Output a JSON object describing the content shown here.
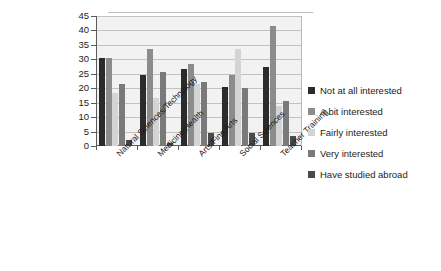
{
  "chart_data": {
    "type": "bar",
    "title": "",
    "subtitle": "",
    "xlabel": "",
    "ylabel": "",
    "ylim": [
      0,
      45
    ],
    "ytick_step": 5,
    "yticks": [
      0,
      5,
      10,
      15,
      20,
      25,
      30,
      35,
      40,
      45
    ],
    "grid": true,
    "legend_position": "right",
    "categories": [
      "Natural Sciences/Technology",
      "Medicine/Health",
      "Arts/Fine Arts",
      "Social Sciences",
      "Teacher Training"
    ],
    "series": [
      {
        "name": "Not at all interested",
        "color": "#2b2b2b",
        "values": [
          30.5,
          24.5,
          26.5,
          20.5,
          27.5
        ]
      },
      {
        "name": "A bit interested",
        "color": "#8c8c8c",
        "values": [
          30.5,
          33.5,
          28.5,
          24.5,
          41.5
        ]
      },
      {
        "name": "Fairly interested",
        "color": "#d4d4d4",
        "values": [
          18.5,
          16.5,
          21.5,
          33.5,
          14.0
        ]
      },
      {
        "name": "Very interested",
        "color": "#7a7a7a",
        "values": [
          21.5,
          25.5,
          22.0,
          20.0,
          15.5
        ]
      },
      {
        "name": "Have studied abroad",
        "color": "#4a4a4a",
        "values": [
          2.0,
          1.0,
          4.5,
          4.5,
          3.5
        ]
      }
    ]
  },
  "legend": {
    "items": [
      {
        "label": "Not at all interested",
        "color": "#2b2b2b"
      },
      {
        "label": "A bit interested",
        "color": "#8c8c8c"
      },
      {
        "label": "Fairly interested",
        "color": "#d4d4d4"
      },
      {
        "label": "Very interested",
        "color": "#7a7a7a"
      },
      {
        "label": "Have studied abroad",
        "color": "#4a4a4a"
      }
    ]
  },
  "axis": {
    "y_tick_labels": [
      "45",
      "40",
      "35",
      "30",
      "25",
      "20",
      "15",
      "10",
      "5",
      "0"
    ]
  }
}
